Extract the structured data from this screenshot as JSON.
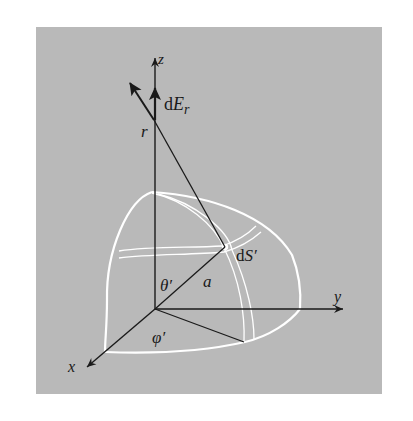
{
  "figure": {
    "background_color": "#b9b9b9",
    "surface_color": "#ffffff",
    "line_color": "#1a1a1a",
    "labels": {
      "z_axis": "z",
      "y_axis": "y",
      "x_axis": "x",
      "field_element_d": "d",
      "field_element_E": "E",
      "field_element_sub": "r",
      "observation_point": "r",
      "surface_element_d": "d",
      "surface_element_S": "S′",
      "polar_angle": "θ′",
      "azimuth_angle": "φ′",
      "radius": "a"
    }
  }
}
